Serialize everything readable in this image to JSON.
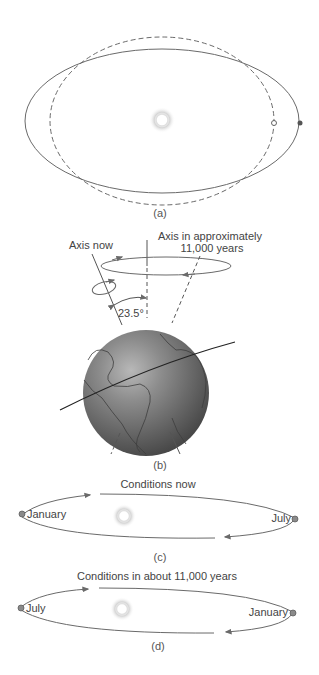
{
  "panels": {
    "a": {
      "label": "(a)",
      "orbit_solid": "elliptical orbit",
      "orbit_dashed": "circular orbit"
    },
    "b": {
      "label": "(b)",
      "axis_now_label": "Axis now",
      "axis_future_label_line1": "Axis in approximately",
      "axis_future_label_line2": "11,000 years",
      "tilt_angle": "23.5°"
    },
    "c": {
      "label": "(c)",
      "title": "Conditions now",
      "left_point": "January",
      "right_point": "July"
    },
    "d": {
      "label": "(d)",
      "title": "Conditions in about 11,000 years",
      "left_point": "July",
      "right_point": "January"
    }
  },
  "colors": {
    "line": "#6a6a6a",
    "globe_dark": "#4a4a4a",
    "globe_light": "#a8a8a8",
    "planet_dot": "#8a8a8a",
    "sun_glow": "#d8d8d8"
  }
}
